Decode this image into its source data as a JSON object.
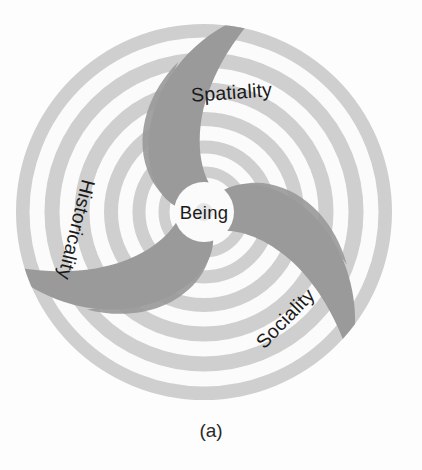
{
  "figure": {
    "caption": "(a)",
    "center_label": "Being",
    "arms": [
      {
        "label": "Spatiality",
        "name": "arm-spatiality",
        "rotation": -4,
        "x": 232,
        "y": 99
      },
      {
        "label": "Historicality",
        "name": "arm-historicality",
        "rotation": 104,
        "x": 70,
        "y": 228
      },
      {
        "label": "Sociality",
        "name": "arm-sociality",
        "rotation": -46,
        "x": 290,
        "y": 323
      }
    ],
    "colors": {
      "background": "#fdfdfd",
      "ring_light": "#f4f4f4",
      "ring_mid": "#cfcfcf",
      "arm_dark": "#9a9a9a",
      "text": "#1b1b1b",
      "caption_text": "#2a2a2a"
    },
    "geometry": {
      "center_x": 204,
      "center_y": 212,
      "outer_radius": 188,
      "ring_count": 6,
      "arm_count": 3
    }
  }
}
